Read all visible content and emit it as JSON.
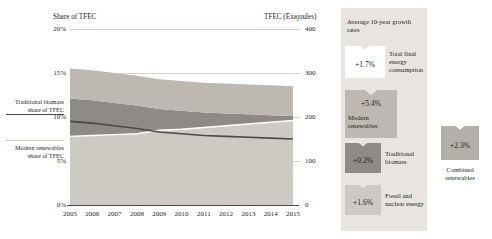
{
  "chart_data": {
    "type": "area",
    "title": "",
    "left_axis": {
      "label": "Share of TFEC",
      "ticks": [
        "0%",
        "5%",
        "10%",
        "15%",
        "20%"
      ],
      "values": [
        0,
        5,
        10,
        15,
        20
      ],
      "ylim": [
        0,
        20
      ]
    },
    "right_axis": {
      "label": "TFEC (Exajoules)",
      "ticks": [
        "0",
        "100",
        "200",
        "300",
        "400"
      ],
      "values": [
        0,
        100,
        200,
        300,
        400
      ],
      "ylim": [
        0,
        400
      ]
    },
    "x": [
      2005,
      2006,
      2007,
      2008,
      2009,
      2010,
      2011,
      2012,
      2013,
      2014,
      2015
    ],
    "xlabels": [
      "2005",
      "2006",
      "2007",
      "2008",
      "2009",
      "2010",
      "2011",
      "2012",
      "2013",
      "2014",
      "2015"
    ],
    "grid": true,
    "stacked_series": [
      {
        "name": "Modern renewables",
        "color": "#bdb8b1",
        "values": [
          7.8,
          7.9,
          8.0,
          8.1,
          8.5,
          8.6,
          8.8,
          9.0,
          9.2,
          9.4,
          9.6
        ]
      },
      {
        "name": "Traditional biomass",
        "color": "#8e8a85",
        "values": [
          9.5,
          9.3,
          9.0,
          8.7,
          8.3,
          8.1,
          7.9,
          7.8,
          7.7,
          7.6,
          7.5
        ]
      },
      {
        "name": "Fossil and nuclear energy",
        "color": "#cdc9c3",
        "values": [
          0.0,
          0.0,
          0.0,
          0.0,
          0.0,
          0.0,
          0.0,
          0.0,
          0.0,
          0.0,
          0.0
        ]
      }
    ],
    "line_series": [
      {
        "name": "Traditional biomass share of TFEC",
        "color": "#4a4a4a",
        "values": [
          9.5,
          9.3,
          9.0,
          8.7,
          8.3,
          8.1,
          7.9,
          7.8,
          7.7,
          7.6,
          7.5
        ]
      },
      {
        "name": "Modern renewables share of TFEC",
        "color": "#ffffff",
        "values": [
          7.8,
          7.9,
          8.0,
          8.1,
          8.5,
          8.6,
          8.8,
          9.0,
          9.2,
          9.4,
          9.6
        ]
      }
    ],
    "annotations": {
      "trad_callout": "Traditional biomass share of TFEC",
      "mod_callout": "Modern renewables share of TFEC"
    },
    "legend": {
      "heading": "Average 10-year growth rates",
      "items": [
        {
          "value": "+1.7%",
          "label": "Total final energy consumption",
          "color": "#ffffff"
        },
        {
          "value": "+5.4%",
          "label": "Modern renewables",
          "color": "#bdb8b1"
        },
        {
          "value": "+0.2%",
          "label": "Traditional biomass",
          "color": "#8e8a85"
        },
        {
          "value": "+1.6%",
          "label": "Fossil and nuclear energy",
          "color": "#cdc9c3"
        }
      ],
      "combined": {
        "value": "+2.3%",
        "label": "Combined renewables",
        "color": "#b4afa8"
      }
    }
  }
}
